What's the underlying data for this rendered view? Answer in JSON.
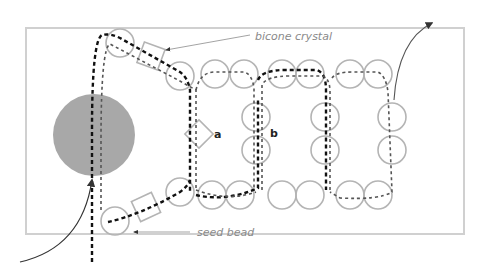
{
  "diagram": {
    "labels": {
      "bicone": "bicone crystal",
      "seed": "seed bead",
      "a": "a",
      "b": "b"
    },
    "colors": {
      "frame": "#d0d0d0",
      "bead_stroke": "#b4b4b4",
      "big_bead_fill": "#a8a8a8",
      "thread_dark": "#111111",
      "thread_light": "#555555",
      "arrow": "#333333",
      "label": "#8a8a8a"
    },
    "frame": {
      "x": 13,
      "y": 14,
      "w": 219,
      "h": 103
    },
    "big_bead": {
      "cx": 94,
      "cy": 135,
      "r": 41
    },
    "seed_beads": [
      {
        "cx": 120,
        "cy": 43
      },
      {
        "cx": 180,
        "cy": 76
      },
      {
        "cx": 215,
        "cy": 74
      },
      {
        "cx": 244,
        "cy": 74
      },
      {
        "cx": 282,
        "cy": 74
      },
      {
        "cx": 310,
        "cy": 74
      },
      {
        "cx": 350,
        "cy": 74
      },
      {
        "cx": 378,
        "cy": 74
      },
      {
        "cx": 256,
        "cy": 117
      },
      {
        "cx": 256,
        "cy": 150
      },
      {
        "cx": 325,
        "cy": 117
      },
      {
        "cx": 325,
        "cy": 150
      },
      {
        "cx": 392,
        "cy": 117
      },
      {
        "cx": 392,
        "cy": 150
      },
      {
        "cx": 115,
        "cy": 221
      },
      {
        "cx": 180,
        "cy": 192
      },
      {
        "cx": 212,
        "cy": 195
      },
      {
        "cx": 240,
        "cy": 195
      },
      {
        "cx": 282,
        "cy": 195
      },
      {
        "cx": 310,
        "cy": 195
      },
      {
        "cx": 350,
        "cy": 195
      },
      {
        "cx": 378,
        "cy": 195
      }
    ],
    "bead_radius": 14,
    "bicones": [
      {
        "cx": 151,
        "cy": 56,
        "size": 22,
        "rot": 20
      },
      {
        "cx": 199,
        "cy": 134,
        "size": 20,
        "rot": 45
      },
      {
        "cx": 146,
        "cy": 207,
        "size": 22,
        "rot": -25
      }
    ]
  }
}
